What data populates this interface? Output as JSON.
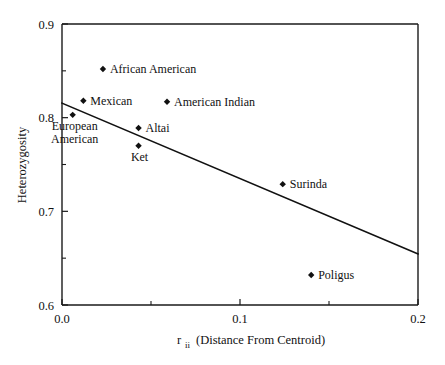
{
  "chart_data": {
    "type": "scatter",
    "title": "",
    "xlabel": "r_ii (Distance From Centroid)",
    "xlabel_main": "r",
    "xlabel_sub": "ii",
    "xlabel_rest": "(Distance From Centroid)",
    "ylabel": "Heterozygosity",
    "xlim": [
      0.0,
      0.2
    ],
    "ylim": [
      0.6,
      0.9
    ],
    "x_ticks": [
      "0.0",
      "0.1",
      "0.2"
    ],
    "x_tick_values": [
      0.0,
      0.1,
      0.2
    ],
    "x_minor_ticks": [
      0.05,
      0.15
    ],
    "y_ticks": [
      "0.9",
      "0.8",
      "0.7",
      "0.6"
    ],
    "y_tick_values": [
      0.9,
      0.8,
      0.7,
      0.6
    ],
    "y_minor_ticks": [
      0.85,
      0.75,
      0.65
    ],
    "grid": false,
    "legend": "none",
    "marker_style": "filled-diamond",
    "points": [
      {
        "label": "African American",
        "x": 0.023,
        "y": 0.852,
        "label_pos": "right"
      },
      {
        "label": "Mexican",
        "x": 0.012,
        "y": 0.818,
        "label_pos": "right"
      },
      {
        "label": "American Indian",
        "x": 0.059,
        "y": 0.817,
        "label_pos": "right"
      },
      {
        "label": "European American",
        "x": 0.006,
        "y": 0.803,
        "label_pos": "below-two-line",
        "line1": "European",
        "line2": "American"
      },
      {
        "label": "Altai",
        "x": 0.043,
        "y": 0.789,
        "label_pos": "right"
      },
      {
        "label": "Ket",
        "x": 0.043,
        "y": 0.77,
        "label_pos": "below"
      },
      {
        "label": "Surinda",
        "x": 0.124,
        "y": 0.729,
        "label_pos": "right"
      },
      {
        "label": "Poligus",
        "x": 0.14,
        "y": 0.632,
        "label_pos": "right"
      }
    ],
    "trendline": {
      "x0": 0.0,
      "y0": 0.8155,
      "x1": 0.2,
      "y1": 0.6545,
      "slope": -0.805,
      "intercept": 0.8155
    },
    "colors": {
      "axis": "#1a1a1a",
      "marker": "#111111",
      "trendline": "#111111",
      "background": "#ffffff"
    }
  }
}
